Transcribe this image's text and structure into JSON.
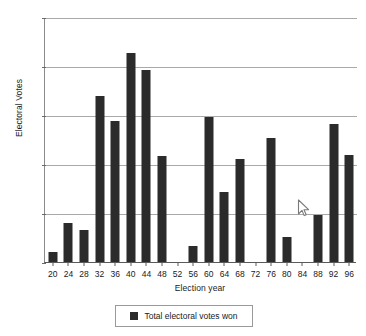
{
  "chart_data": {
    "type": "bar",
    "title": "",
    "xlabel": "Election year",
    "ylabel": "Electoral Votes",
    "categories": [
      "20",
      "24",
      "28",
      "32",
      "36",
      "40",
      "44",
      "48",
      "52",
      "56",
      "60",
      "64",
      "68",
      "72",
      "76",
      "80",
      "84",
      "88",
      "92",
      "96"
    ],
    "values": [
      10,
      40,
      33,
      169,
      144,
      213,
      196,
      108,
      0,
      16,
      148,
      71,
      105,
      0,
      127,
      26,
      0,
      48,
      141,
      109
    ],
    "series": [
      {
        "name": "Total electoral votes won",
        "values": [
          10,
          40,
          33,
          169,
          144,
          213,
          196,
          108,
          0,
          16,
          148,
          71,
          105,
          0,
          127,
          26,
          0,
          48,
          141,
          109
        ]
      }
    ],
    "ylim": [
      0,
      250
    ],
    "yticks": [
      0,
      50,
      100,
      150,
      200,
      250
    ],
    "ytick_labels": [
      "0",
      "50",
      "100",
      "150",
      "200",
      "250"
    ],
    "grid": true,
    "legend_position": "bottom",
    "bar_color": "#2b2b2b"
  },
  "legend": {
    "entries": [
      {
        "label": "Total electoral votes won",
        "color": "#2b2b2b"
      }
    ]
  },
  "cursor": {
    "icon": "mouse-pointer-icon"
  }
}
